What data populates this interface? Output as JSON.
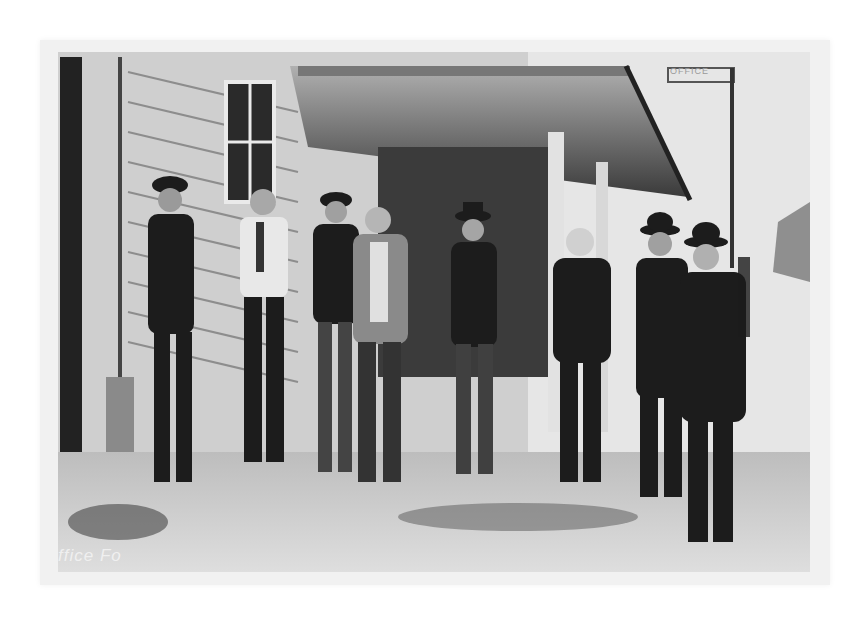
{
  "photo": {
    "description": "Vintage black-and-white photograph of nine men standing in front of a clapboard building with a porch overhang",
    "caption_fragment": "ffice Fo",
    "sign_text": "OFFICE",
    "palette": {
      "paper": "#f1f1f1",
      "sky": "#e6e6e6",
      "siding": "#cfcfcf",
      "shadow": "#1c1c1c",
      "ground": "#d2d2d2"
    },
    "people_count": 9
  }
}
